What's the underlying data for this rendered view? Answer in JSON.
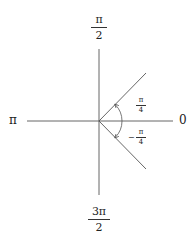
{
  "diagram": {
    "type": "unit-circle-angle-diagram",
    "origin": {
      "x": 99,
      "y": 121
    },
    "axes": {
      "horizontal": {
        "x1": 27,
        "x2": 173,
        "y": 121
      },
      "vertical": {
        "x": 99,
        "y1": 49,
        "y2": 195
      }
    },
    "rays": [
      {
        "angle": "pi/4",
        "x2": 146,
        "y2": 73
      },
      {
        "angle": "-pi/4",
        "x2": 146,
        "y2": 169
      }
    ],
    "arcs": [
      {
        "from": 0,
        "to": "pi/4",
        "radius": 23,
        "direction": "counterclockwise"
      },
      {
        "from": 0,
        "to": "-pi/4",
        "radius": 23,
        "direction": "clockwise"
      }
    ],
    "colors": {
      "line": "#555555",
      "text": "#222222",
      "background": "#ffffff"
    }
  },
  "labels": {
    "top": {
      "num": "π",
      "den": "2"
    },
    "bottom": {
      "num": "3π",
      "den": "2"
    },
    "left": "π",
    "right": "0",
    "angle_pos": {
      "num": "π",
      "den": "4"
    },
    "angle_neg": {
      "sign": "−",
      "num": "π",
      "den": "4"
    }
  }
}
